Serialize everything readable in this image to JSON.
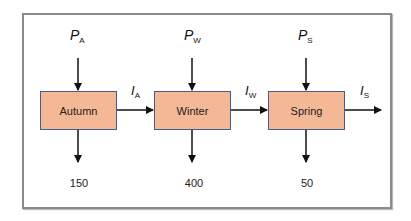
{
  "diagram": {
    "stages": [
      {
        "name": "Autumn",
        "input_symbol": "P",
        "input_sub": "A",
        "output_symbol": "I",
        "output_sub": "A",
        "drain_value": "150"
      },
      {
        "name": "Winter",
        "input_symbol": "P",
        "input_sub": "W",
        "output_symbol": "I",
        "output_sub": "W",
        "drain_value": "400"
      },
      {
        "name": "Spring",
        "input_symbol": "P",
        "input_sub": "S",
        "output_symbol": "I",
        "output_sub": "S",
        "drain_value": "50"
      }
    ],
    "colors": {
      "box_fill": "#f4b896",
      "box_border": "#4a5a8a",
      "frame": "#8a8a8a",
      "arrow": "#111111"
    }
  }
}
